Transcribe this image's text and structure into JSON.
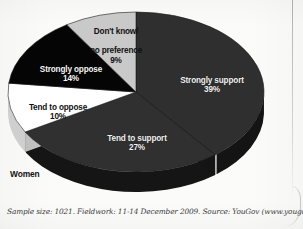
{
  "chart_data": {
    "type": "pie",
    "title": "",
    "subtitle": "",
    "group_caption": "Women",
    "categories": [
      "Strongly support",
      "Tend to support",
      "Tend to oppose",
      "Strongly oppose",
      "Don't know/\nno preference"
    ],
    "values": [
      39,
      27,
      10,
      14,
      9
    ],
    "value_labels": [
      "39%",
      "27%",
      "10%",
      "14%",
      "9%"
    ],
    "unit": "%",
    "legend_position": "none",
    "grid": false,
    "three_d": true,
    "start_angle_deg": 0,
    "direction": "clockwise",
    "slices": [
      {
        "label": "Strongly support",
        "value": 39,
        "value_label": "39%",
        "color": "#2f2f2f",
        "side_color": "#141414",
        "text_color": "#f2f2f2"
      },
      {
        "label": "Tend to support",
        "value": 27,
        "value_label": "27%",
        "color": "#303030",
        "side_color": "#151515",
        "text_color": "#f2f2f2"
      },
      {
        "label": "Tend to oppose",
        "value": 10,
        "value_label": "10%",
        "color": "#ffffff",
        "side_color": "#cfcfcf",
        "text_color": "#111111"
      },
      {
        "label": "Strongly oppose",
        "value": 14,
        "value_label": "14%",
        "color": "#050505",
        "side_color": "#000000",
        "text_color": "#f5f5f5"
      },
      {
        "label": "Don't know/\nno preference",
        "value": 9,
        "value_label": "9%",
        "color": "#c9c9c9",
        "side_color": "#9a9a9a",
        "text_color": "#101010"
      }
    ]
  },
  "labels": {
    "strongly_support": {
      "text": "Strongly support",
      "pct": "39%"
    },
    "tend_to_support": {
      "text": "Tend to support",
      "pct": "27%"
    },
    "tend_to_oppose": {
      "text": "Tend to oppose",
      "pct": "10%"
    },
    "strongly_oppose": {
      "text": "Strongly oppose",
      "pct": "14%"
    },
    "dont_know": {
      "line1": "Don't know/",
      "line2": "no preference",
      "pct": "9%"
    }
  },
  "group_caption": "Women",
  "footnote": "Sample size: 1021. Fieldwork: 11-14 December 2009. Source: YouGov (www.yougov.com)",
  "colors": {
    "strongly_support": "#2f2f2f",
    "tend_to_support": "#303030",
    "tend_to_oppose": "#ffffff",
    "strongly_oppose": "#050505",
    "dont_know": "#c9c9c9",
    "background": "#fbfbfa",
    "text_dark": "#111111",
    "text_light": "#f2f2f2"
  }
}
